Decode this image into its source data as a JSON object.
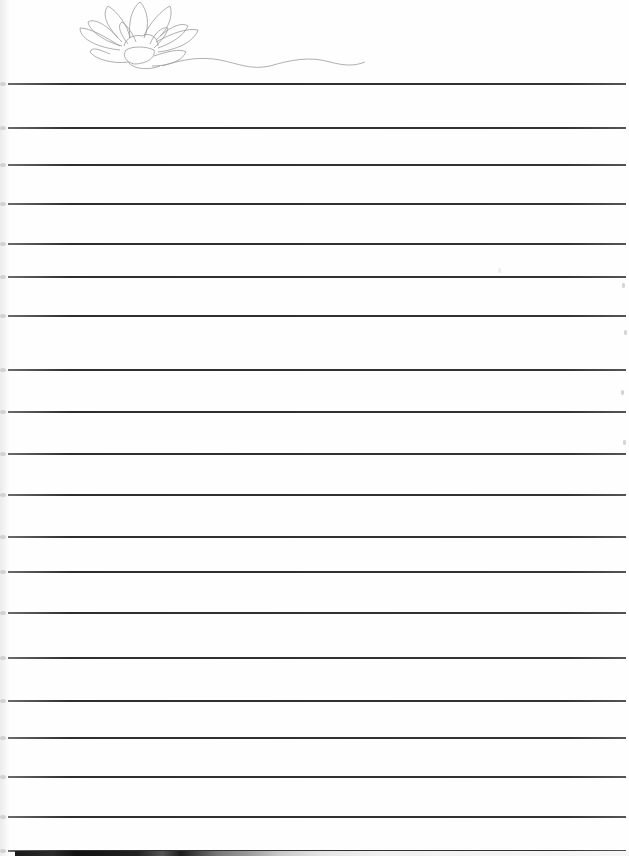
{
  "document": {
    "type": "lined-notepaper",
    "header_art": "lotus-flower-line-drawing",
    "ruled_lines_y": [
      83,
      127,
      164,
      203,
      243,
      276,
      315,
      369,
      411,
      453,
      494,
      536,
      571,
      612,
      657,
      700,
      737,
      776,
      816,
      850
    ],
    "line_color": "#333333",
    "paper_color": "#fefefe",
    "art_stroke_color": "#9a9a9a"
  }
}
